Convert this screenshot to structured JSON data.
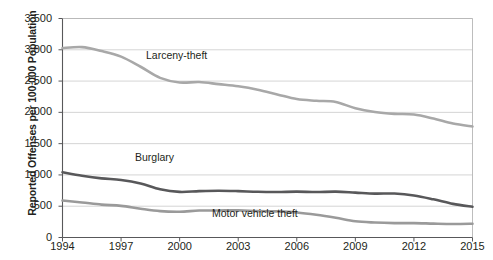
{
  "chart_data": {
    "type": "line",
    "title": "",
    "xlabel": "",
    "ylabel": "Reported Offenses per 100,000 Population",
    "xlim": [
      1994,
      2015
    ],
    "ylim": [
      0,
      3500
    ],
    "ytick_labels": [
      "3,500",
      "3,000",
      "2,500",
      "2,000",
      "1,500",
      "1,000",
      "500",
      "0"
    ],
    "ytick_values": [
      3500,
      3000,
      2500,
      2000,
      1500,
      1000,
      500,
      0
    ],
    "xtick_labels": [
      "1994",
      "1997",
      "2000",
      "2003",
      "2006",
      "2009",
      "2012",
      "2015"
    ],
    "xtick_values": [
      1994,
      1997,
      2000,
      2003,
      2006,
      2009,
      2012,
      2015
    ],
    "grid": true,
    "legend_position": "inline-annotations",
    "x": [
      1994,
      1995,
      1996,
      1997,
      1998,
      1999,
      2000,
      2001,
      2002,
      2003,
      2004,
      2005,
      2006,
      2007,
      2008,
      2009,
      2010,
      2011,
      2012,
      2013,
      2014,
      2015
    ],
    "series": [
      {
        "name": "Larceny-theft",
        "color": "#a8a8a8",
        "values": [
          3026,
          3043,
          2980,
          2891,
          2729,
          2551,
          2477,
          2485,
          2451,
          2416,
          2362,
          2287,
          2213,
          2185,
          2166,
          2064,
          2005,
          1976,
          1965,
          1901,
          1821,
          1775
        ]
      },
      {
        "name": "Burglary",
        "color": "#58585a",
        "values": [
          1042,
          987,
          945,
          919,
          863,
          770,
          729,
          741,
          747,
          741,
          730,
          727,
          733,
          726,
          733,
          717,
          701,
          702,
          672,
          610,
          537,
          491
        ]
      },
      {
        "name": "Motor vehicle theft",
        "color": "#9a9a9a",
        "values": [
          591,
          560,
          526,
          506,
          460,
          422,
          412,
          431,
          432,
          433,
          422,
          417,
          400,
          364,
          315,
          259,
          239,
          230,
          230,
          222,
          216,
          220
        ]
      }
    ],
    "annotations": [
      {
        "text": "Larceny-theft",
        "x": 146,
        "y": 50
      },
      {
        "text": "Burglary",
        "x": 135,
        "y": 152
      },
      {
        "text": "Motor vehicle theft",
        "x": 212,
        "y": 208
      }
    ]
  },
  "axis": {
    "y_title": "Reported Offenses per 100,000 Population"
  }
}
